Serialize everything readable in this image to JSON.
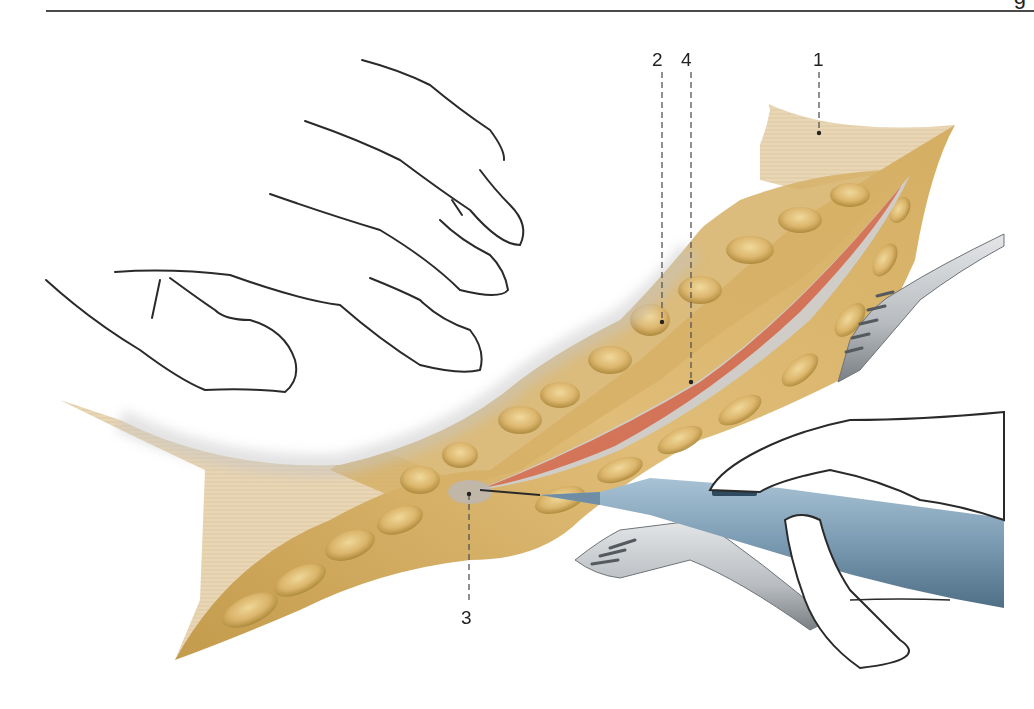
{
  "header": {
    "cropped_glyph": "g"
  },
  "figure": {
    "colors": {
      "skin": "#e9d6b4",
      "skin_dark": "#d8bf93",
      "fat": "#d8b167",
      "fat_light": "#ecd08e",
      "fat_shadow": "#a98638",
      "fascia_muscle": "#d7745a",
      "fascia_edge": "#c9c6c2",
      "glove": "#ffffff",
      "glove_shadow": "#c9c9c9",
      "glove_outline": "#2a2a2a",
      "cautery_pen": "#7f9fb6",
      "cautery_pen_dark": "#53748b",
      "retractor": "#b8bcc0",
      "retractor_dark": "#6e7378",
      "leader_line": "#555555"
    },
    "labels": [
      {
        "id": "1",
        "text": "1",
        "x": 813,
        "y": 50,
        "line_x": 819,
        "line_y1": 72,
        "line_y2": 133
      },
      {
        "id": "2",
        "text": "2",
        "x": 652,
        "y": 50,
        "line_x": 662,
        "line_y1": 72,
        "line_y2": 322
      },
      {
        "id": "4",
        "text": "4",
        "x": 681,
        "y": 50,
        "line_x": 691,
        "line_y1": 72,
        "line_y2": 382
      },
      {
        "id": "3",
        "text": "3",
        "x": 461,
        "y": 608,
        "line_x": 469,
        "line_y1": 494,
        "line_y2": 600
      }
    ]
  }
}
